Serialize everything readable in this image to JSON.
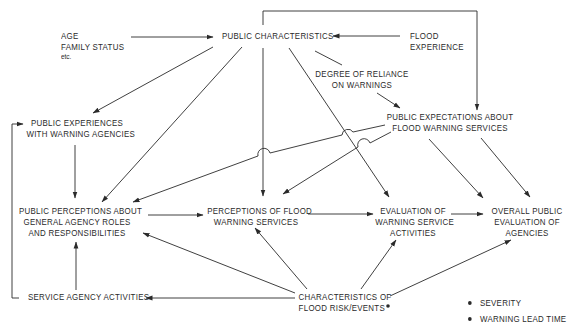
{
  "diagram": {
    "type": "flow-diagram",
    "nodes": {
      "demographics": {
        "lines": [
          "AGE",
          "FAMILY STATUS"
        ],
        "note": "etc."
      },
      "public_characteristics": {
        "lines": [
          "PUBLIC CHARACTERISTICS"
        ]
      },
      "flood_experience": {
        "lines": [
          "FLOOD",
          "EXPERIENCE"
        ]
      },
      "degree_of_reliance": {
        "lines": [
          "DEGREE OF RELIANCE",
          "ON WARNINGS"
        ]
      },
      "public_experiences": {
        "lines": [
          "PUBLIC EXPERIENCES",
          "WITH WARNING AGENCIES"
        ]
      },
      "public_expectations": {
        "lines": [
          "PUBLIC EXPECTATIONS ABOUT",
          "FLOOD WARNING SERVICES"
        ]
      },
      "public_perceptions_roles": {
        "lines": [
          "PUBLIC PERCEPTIONS ABOUT",
          "GENERAL AGENCY ROLES",
          "AND RESPONSIBILITIES"
        ]
      },
      "perceptions_flood_warning": {
        "lines": [
          "PERCEPTIONS OF FLOOD",
          "WARNING SERVICES"
        ]
      },
      "evaluation_warning_service": {
        "lines": [
          "EVALUATION OF",
          "WARNING SERVICE",
          "ACTIVITIES"
        ]
      },
      "overall_evaluation": {
        "lines": [
          "OVERALL PUBLIC",
          "EVALUATION OF",
          "AGENCIES"
        ]
      },
      "service_agency_activities": {
        "lines": [
          "SERVICE AGENCY ACTIVITIES"
        ]
      },
      "flood_risk_characteristics": {
        "lines": [
          "CHARACTERISTICS OF",
          "FLOOD RISK/EVENTS"
        ]
      }
    },
    "legend": {
      "items": [
        "SEVERITY",
        "WARNING LEAD TIME"
      ]
    },
    "edges": [
      {
        "from": "demographics",
        "to": "public_characteristics"
      },
      {
        "from": "flood_experience",
        "to": "public_characteristics"
      },
      {
        "from": "flood_experience",
        "to": "public_expectations",
        "route": "top-feedback"
      },
      {
        "from": "public_characteristics",
        "to": "degree_of_reliance"
      },
      {
        "from": "degree_of_reliance",
        "to": "public_expectations"
      },
      {
        "from": "public_characteristics",
        "to": "public_experiences"
      },
      {
        "from": "public_characteristics",
        "to": "public_perceptions_roles"
      },
      {
        "from": "public_characteristics",
        "to": "perceptions_flood_warning"
      },
      {
        "from": "public_characteristics",
        "to": "evaluation_warning_service"
      },
      {
        "from": "public_experiences",
        "to": "public_perceptions_roles"
      },
      {
        "from": "public_expectations",
        "to": "public_perceptions_roles"
      },
      {
        "from": "public_expectations",
        "to": "perceptions_flood_warning"
      },
      {
        "from": "public_expectations",
        "to": "evaluation_warning_service"
      },
      {
        "from": "public_expectations",
        "to": "overall_evaluation"
      },
      {
        "from": "public_perceptions_roles",
        "to": "perceptions_flood_warning"
      },
      {
        "from": "perceptions_flood_warning",
        "to": "evaluation_warning_service"
      },
      {
        "from": "evaluation_warning_service",
        "to": "overall_evaluation"
      },
      {
        "from": "service_agency_activities",
        "to": "public_perceptions_roles"
      },
      {
        "from": "service_agency_activities",
        "to": "public_experiences",
        "route": "left-feedback"
      },
      {
        "from": "flood_risk_characteristics",
        "to": "service_agency_activities"
      },
      {
        "from": "flood_risk_characteristics",
        "to": "public_perceptions_roles"
      },
      {
        "from": "flood_risk_characteristics",
        "to": "perceptions_flood_warning"
      },
      {
        "from": "flood_risk_characteristics",
        "to": "evaluation_warning_service"
      },
      {
        "from": "flood_risk_characteristics",
        "to": "overall_evaluation"
      }
    ],
    "colors": {
      "ink": "#2a2a2a",
      "background": "#ffffff"
    }
  }
}
